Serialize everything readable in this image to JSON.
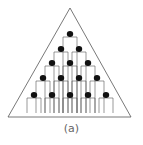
{
  "figure": {
    "caption": "(a)",
    "shape": "triangle",
    "rows": [
      1,
      2,
      3,
      4,
      5
    ],
    "figure_count": 15,
    "colors": {
      "stroke": "#555555",
      "head": "#111111",
      "background": "#ffffff"
    }
  }
}
